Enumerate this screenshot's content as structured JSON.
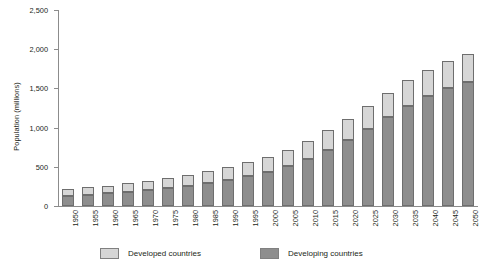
{
  "chart_data": {
    "type": "bar",
    "stacked": true,
    "title": "",
    "xlabel": "",
    "ylabel": "Population (millions)",
    "ylim": [
      0,
      2500
    ],
    "yticks": [
      0,
      500,
      1000,
      1500,
      2000,
      2500
    ],
    "ytick_labels": [
      "0",
      "500",
      "1,000",
      "1,500",
      "2,000",
      "2,500"
    ],
    "grid": false,
    "legend_position": "bottom",
    "categories": [
      "1950",
      "1955",
      "1960",
      "1965",
      "1970",
      "1975",
      "1980",
      "1985",
      "1990",
      "1995",
      "2000",
      "2005",
      "2010",
      "2015",
      "2020",
      "2025",
      "2030",
      "2035",
      "2040",
      "2045",
      "2050"
    ],
    "series": [
      {
        "name": "Developing countries",
        "color": "#8e8e8e",
        "values": [
          130,
          145,
          160,
          180,
          205,
          230,
          260,
          295,
          335,
          385,
          440,
          510,
          600,
          720,
          840,
          985,
          1140,
          1280,
          1400,
          1500,
          1580
        ]
      },
      {
        "name": "Developed countries",
        "color": "#d6d6d6",
        "values": [
          90,
          95,
          100,
          110,
          120,
          130,
          140,
          150,
          160,
          175,
          190,
          205,
          225,
          245,
          265,
          285,
          305,
          325,
          340,
          350,
          360
        ]
      }
    ],
    "totals": [
      220,
      240,
      260,
      290,
      325,
      360,
      400,
      445,
      495,
      560,
      630,
      715,
      825,
      965,
      1105,
      1270,
      1445,
      1605,
      1740,
      1850,
      1940
    ]
  },
  "legend": {
    "items": [
      {
        "label": "Developed countries",
        "swatch": "developed"
      },
      {
        "label": "Developing countries",
        "swatch": "developing"
      }
    ]
  }
}
